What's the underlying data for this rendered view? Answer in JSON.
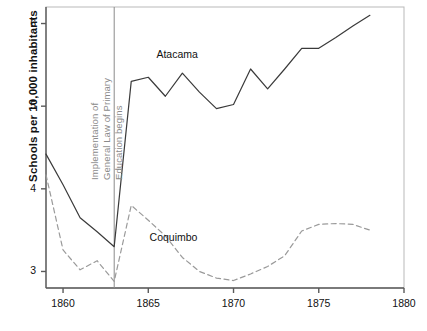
{
  "chart_data": {
    "type": "line",
    "title": "",
    "xlabel": "",
    "ylabel": "Schools per 10,000 inhabitants",
    "xlim": [
      1859,
      1880
    ],
    "ylim": [
      2.8,
      6.2
    ],
    "xticks": [
      1860,
      1865,
      1870,
      1875,
      1880
    ],
    "xtick_labels": [
      "1860",
      "1865",
      "1870",
      "1875",
      "1880"
    ],
    "yticks": [
      3,
      4,
      5,
      6
    ],
    "ytick_labels": [
      "3",
      "4",
      "5",
      "6"
    ],
    "grid": false,
    "legend_position": "inline-labels",
    "annotations": [
      {
        "name": "reference-line-1863",
        "type": "vline",
        "x": 1863,
        "text_lines": [
          "Implementation of",
          "General Law of Primary",
          "Education begins"
        ],
        "color": "#8a8a8a"
      }
    ],
    "series": [
      {
        "name": "Atacama",
        "style": "solid",
        "color": "#3a3a3a",
        "label_x": 1867,
        "label_y": 5.62,
        "x": [
          1859,
          1860,
          1861,
          1862,
          1863,
          1864,
          1865,
          1866,
          1867,
          1868,
          1869,
          1870,
          1871,
          1872,
          1873,
          1874,
          1875,
          1876,
          1877,
          1878
        ],
        "values": [
          4.42,
          4.05,
          3.65,
          3.48,
          3.3,
          5.3,
          5.35,
          5.12,
          5.4,
          5.17,
          4.97,
          5.02,
          5.45,
          5.21,
          5.45,
          5.7,
          5.7,
          5.83,
          5.97,
          6.1
        ]
      },
      {
        "name": "Coquimbo",
        "style": "dashed",
        "color": "#9a9a9a",
        "label_x": 1866.6,
        "label_y": 3.4,
        "x": [
          1859,
          1860,
          1861,
          1862,
          1863,
          1864,
          1865,
          1866,
          1867,
          1868,
          1869,
          1870,
          1871,
          1872,
          1873,
          1874,
          1875,
          1876,
          1877,
          1878
        ],
        "values": [
          4.17,
          3.26,
          3.02,
          3.13,
          2.88,
          3.8,
          3.62,
          3.43,
          3.17,
          3.0,
          2.92,
          2.89,
          2.97,
          3.06,
          3.19,
          3.49,
          3.57,
          3.58,
          3.57,
          3.5
        ]
      }
    ]
  },
  "axis": {
    "frame_color": "#5a5a5a"
  }
}
